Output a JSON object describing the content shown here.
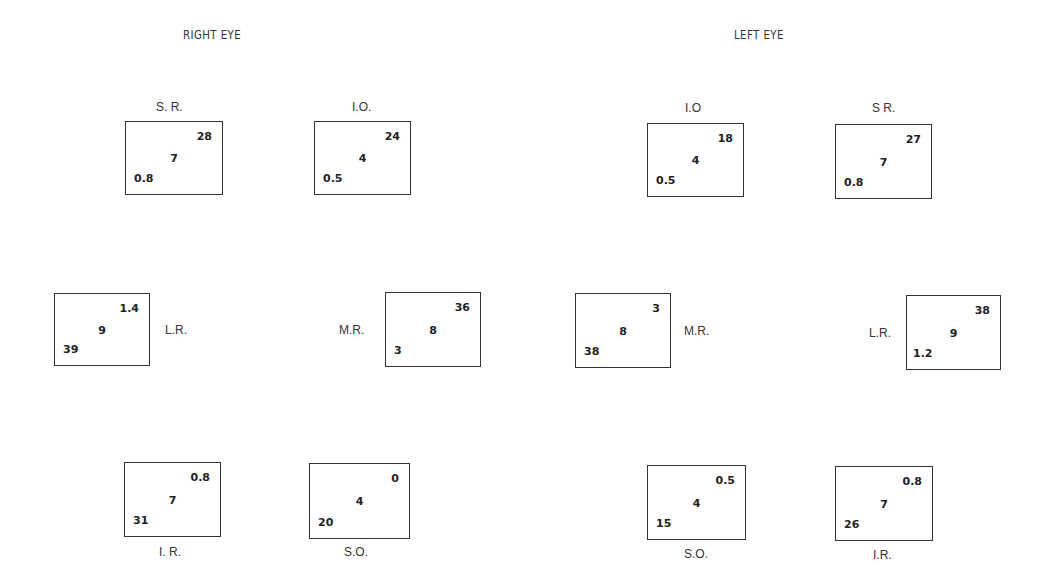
{
  "right_eye": {
    "title": "RIGHT EYE",
    "muscles": {
      "SR": {
        "label": "S. R.",
        "top": "28",
        "center": "7",
        "bottom": "0.8"
      },
      "IO": {
        "label": "I.O.",
        "top": "24",
        "center": "4",
        "bottom": "0.5"
      },
      "LR": {
        "label": "L.R.",
        "top": "1.4",
        "center": "9",
        "bottom": "39"
      },
      "MR": {
        "label": "M.R.",
        "top": "36",
        "center": "8",
        "bottom": "3"
      },
      "IR": {
        "label": "I. R.",
        "top": "0.8",
        "center": "7",
        "bottom": "31"
      },
      "SO": {
        "label": "S.O.",
        "top": "0",
        "center": "4",
        "bottom": "20"
      }
    }
  },
  "left_eye": {
    "title": "LEFT  EYE",
    "muscles": {
      "IO": {
        "label": "I.O",
        "top": "18",
        "center": "4",
        "bottom": "0.5"
      },
      "SR": {
        "label": "S R.",
        "top": "27",
        "center": "7",
        "bottom": "0.8"
      },
      "MR": {
        "label": "M.R.",
        "top": "3",
        "center": "8",
        "bottom": "38"
      },
      "LR": {
        "label": "L.R.",
        "top": "38",
        "center": "9",
        "bottom": "1.2"
      },
      "SO": {
        "label": "S.O.",
        "top": "0.5",
        "center": "4",
        "bottom": "15"
      },
      "IR": {
        "label": "I.R.",
        "top": "0.8",
        "center": "7",
        "bottom": "26"
      }
    }
  }
}
